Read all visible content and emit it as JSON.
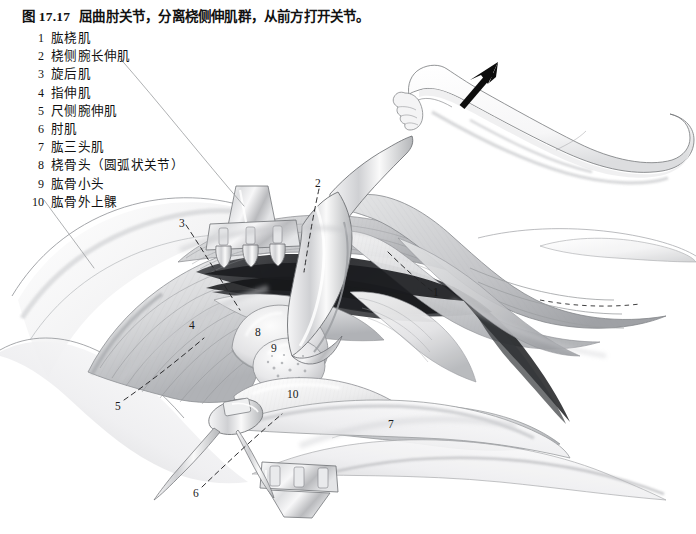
{
  "figure": {
    "number": "图 17.17",
    "title": "屈曲肘关节，分离桡侧伸肌群，从前方打开关节。"
  },
  "legend": {
    "items": [
      {
        "num": "1",
        "label": "肱桡肌"
      },
      {
        "num": "2",
        "label": "桡侧腕长伸肌"
      },
      {
        "num": "3",
        "label": "旋后肌"
      },
      {
        "num": "4",
        "label": "指伸肌"
      },
      {
        "num": "5",
        "label": "尺侧腕伸肌"
      },
      {
        "num": "6",
        "label": "肘肌"
      },
      {
        "num": "7",
        "label": "肱三头肌"
      },
      {
        "num": "8",
        "label": "桡骨头（圆弧状关节）"
      },
      {
        "num": "9",
        "label": "肱骨小头"
      },
      {
        "num": "10",
        "label": "肱骨外上髁"
      }
    ]
  },
  "callouts": [
    {
      "num": "1",
      "x": 433,
      "y": 287
    },
    {
      "num": "2",
      "x": 315,
      "y": 178
    },
    {
      "num": "3",
      "x": 179,
      "y": 218
    },
    {
      "num": "4",
      "x": 189,
      "y": 320
    },
    {
      "num": "5",
      "x": 115,
      "y": 401
    },
    {
      "num": "6",
      "x": 193,
      "y": 488
    },
    {
      "num": "7",
      "x": 388,
      "y": 419
    },
    {
      "num": "8",
      "x": 255,
      "y": 327
    },
    {
      "num": "9",
      "x": 271,
      "y": 343
    },
    {
      "num": "10",
      "x": 287,
      "y": 389
    }
  ],
  "illustration": {
    "kind": "pencil-anatomical-drawing",
    "subject": "elbow-joint-anterior-approach",
    "inset": {
      "kind": "flexed-arm-position-diagram",
      "arrow": "black-solid-arrow-up-right"
    },
    "instruments": [
      "three-prong-retractor-top",
      "three-prong-retractor-bottom",
      "blunt-retractor-blade-upper-right",
      "double-hook-retractor-left"
    ],
    "colors": {
      "background": "#ffffff",
      "ink": "#1a1a1a",
      "shade_light": "#e9e9ea",
      "shade_mid": "#c6c7c9",
      "shade_dark": "#8d8f93",
      "shade_deep": "#3a3c40",
      "leader_line": "#2b2b2b"
    }
  }
}
